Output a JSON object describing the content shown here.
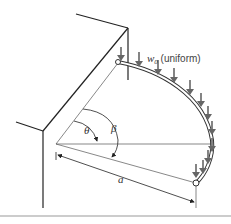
{
  "diagram": {
    "load_label_symbol": "w",
    "load_label_subscript": "0",
    "load_label_note": " (uniform)",
    "angle_theta": "θ",
    "angle_beta": "β",
    "radius_label": "a"
  },
  "colors": {
    "line": "#222222",
    "arrow": "#666666",
    "thin": "#555555",
    "divider": "#bbbbbb"
  }
}
